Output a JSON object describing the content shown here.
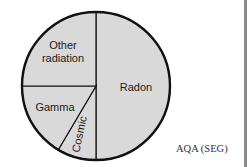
{
  "chart_data": {
    "type": "pie",
    "title": "",
    "start": "top",
    "direction": "clockwise",
    "slices": [
      {
        "label": "Radon",
        "value": 50
      },
      {
        "label": "Cosmic",
        "value": 8.5
      },
      {
        "label": "Gamma",
        "value": 16.5
      },
      {
        "label": "Other radiation",
        "value": 25
      }
    ],
    "label_lines": {
      "Other radiation": [
        "Other",
        "radiation"
      ],
      "Radon": [
        "Radon"
      ],
      "Gamma": [
        "Gamma"
      ],
      "Cosmic": [
        "Cosmic"
      ]
    },
    "colors": {
      "fill": "#d9d9d9",
      "stroke": "#111111"
    }
  },
  "source": "AQA (SEG)"
}
